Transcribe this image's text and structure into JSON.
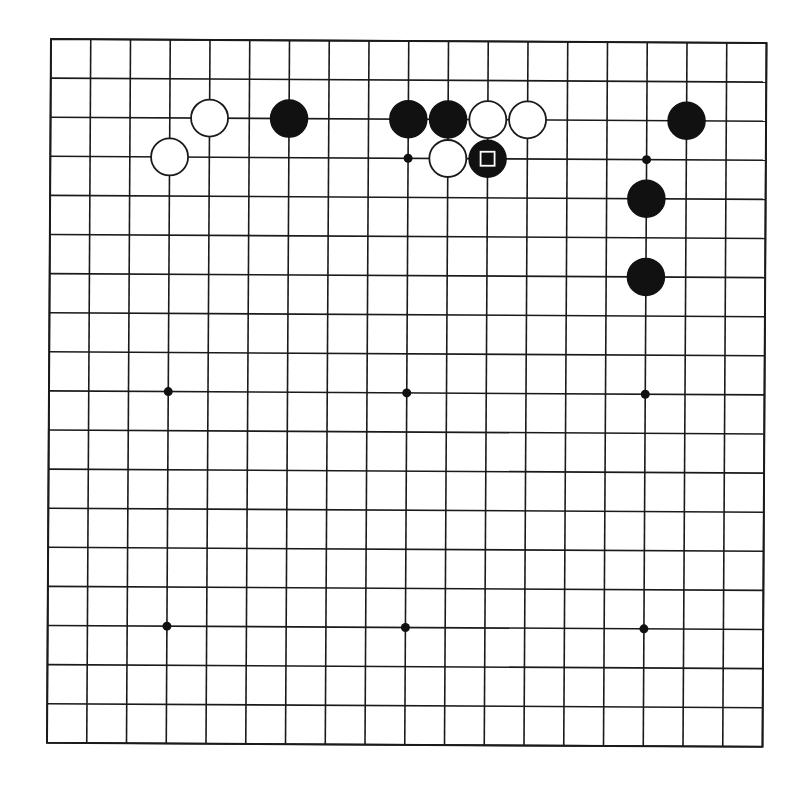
{
  "board": {
    "size": 19,
    "origin_x": 51,
    "origin_y": 39,
    "spacing_x": 39.75,
    "spacing_y": 39.1,
    "stone_radius": 18.5,
    "line_color": "#1a1a1a",
    "background": "#ffffff"
  },
  "star_points": [
    {
      "col": 4,
      "row": 4
    },
    {
      "col": 10,
      "row": 4
    },
    {
      "col": 16,
      "row": 4
    },
    {
      "col": 4,
      "row": 10
    },
    {
      "col": 10,
      "row": 10
    },
    {
      "col": 16,
      "row": 10
    },
    {
      "col": 4,
      "row": 16
    },
    {
      "col": 10,
      "row": 16
    },
    {
      "col": 16,
      "row": 16
    }
  ],
  "stones": [
    {
      "color": "white",
      "col": 5,
      "row": 3
    },
    {
      "color": "white",
      "col": 4,
      "row": 4
    },
    {
      "color": "black",
      "col": 7,
      "row": 3
    },
    {
      "color": "black",
      "col": 10,
      "row": 3
    },
    {
      "color": "black",
      "col": 11,
      "row": 3
    },
    {
      "color": "white",
      "col": 12,
      "row": 3
    },
    {
      "color": "white",
      "col": 13,
      "row": 3
    },
    {
      "color": "white",
      "col": 11,
      "row": 4
    },
    {
      "color": "black",
      "col": 12,
      "row": 4,
      "marker": "square"
    },
    {
      "color": "black",
      "col": 17,
      "row": 3
    },
    {
      "color": "black",
      "col": 16,
      "row": 5
    },
    {
      "color": "black",
      "col": 16,
      "row": 7
    }
  ],
  "last_move": {
    "color": "black",
    "col": 12,
    "row": 4,
    "marker": "square"
  }
}
